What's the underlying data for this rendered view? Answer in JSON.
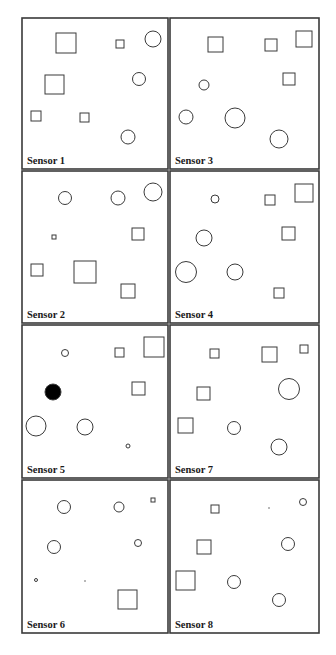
{
  "figure": {
    "colors": {
      "stroke": "#3a3a3a",
      "background": "#ffffff",
      "filled": "#000000",
      "label": "#1a1a1a"
    },
    "panels": [
      {
        "label": "Sensor 1",
        "x": 22,
        "y": 18,
        "w": 146,
        "h": 151,
        "shapes": [
          {
            "type": "square",
            "x": 56,
            "y": 33,
            "s": 20
          },
          {
            "type": "square",
            "x": 116,
            "y": 40,
            "s": 8
          },
          {
            "type": "circle",
            "cx": 153,
            "cy": 39,
            "r": 8
          },
          {
            "type": "square",
            "x": 45,
            "y": 75,
            "s": 19
          },
          {
            "type": "circle",
            "cx": 139,
            "cy": 79,
            "r": 6.5
          },
          {
            "type": "square",
            "x": 31,
            "y": 111,
            "s": 10
          },
          {
            "type": "square",
            "x": 80,
            "y": 113,
            "s": 9
          },
          {
            "type": "circle",
            "cx": 128,
            "cy": 137,
            "r": 7
          }
        ]
      },
      {
        "label": "Sensor 3",
        "x": 170,
        "y": 18,
        "w": 149,
        "h": 151,
        "shapes": [
          {
            "type": "square",
            "x": 208,
            "y": 37,
            "s": 15
          },
          {
            "type": "square",
            "x": 265,
            "y": 39,
            "s": 12
          },
          {
            "type": "square",
            "x": 296,
            "y": 31,
            "s": 16
          },
          {
            "type": "circle",
            "cx": 204,
            "cy": 85,
            "r": 5
          },
          {
            "type": "square",
            "x": 283,
            "y": 73,
            "s": 12
          },
          {
            "type": "circle",
            "cx": 186,
            "cy": 117,
            "r": 7
          },
          {
            "type": "circle",
            "cx": 235,
            "cy": 118,
            "r": 10
          },
          {
            "type": "circle",
            "cx": 279,
            "cy": 139,
            "r": 9
          }
        ]
      },
      {
        "label": "Sensor 2",
        "x": 22,
        "y": 171,
        "w": 146,
        "h": 152,
        "shapes": [
          {
            "type": "circle",
            "cx": 65,
            "cy": 198,
            "r": 6.5
          },
          {
            "type": "circle",
            "cx": 118,
            "cy": 198,
            "r": 7
          },
          {
            "type": "circle",
            "cx": 153,
            "cy": 192,
            "r": 9
          },
          {
            "type": "square",
            "x": 52,
            "y": 235,
            "s": 4
          },
          {
            "type": "square",
            "x": 132,
            "y": 228,
            "s": 12
          },
          {
            "type": "square",
            "x": 31,
            "y": 264,
            "s": 12
          },
          {
            "type": "square",
            "x": 74,
            "y": 261,
            "s": 22
          },
          {
            "type": "square",
            "x": 121,
            "y": 284,
            "s": 14
          }
        ]
      },
      {
        "label": "Sensor 4",
        "x": 170,
        "y": 171,
        "w": 149,
        "h": 152,
        "shapes": [
          {
            "type": "circle",
            "cx": 215,
            "cy": 199,
            "r": 4
          },
          {
            "type": "square",
            "x": 265,
            "y": 195,
            "s": 10
          },
          {
            "type": "square",
            "x": 295,
            "y": 184,
            "s": 18
          },
          {
            "type": "circle",
            "cx": 204,
            "cy": 238,
            "r": 8
          },
          {
            "type": "square",
            "x": 282,
            "y": 227,
            "s": 13
          },
          {
            "type": "circle",
            "cx": 186,
            "cy": 272,
            "r": 10.5
          },
          {
            "type": "circle",
            "cx": 235,
            "cy": 272,
            "r": 8
          },
          {
            "type": "square",
            "x": 274,
            "y": 288,
            "s": 10
          }
        ]
      },
      {
        "label": "Sensor 5",
        "x": 22,
        "y": 325,
        "w": 146,
        "h": 153,
        "shapes": [
          {
            "type": "circle",
            "cx": 65,
            "cy": 353,
            "r": 3.5
          },
          {
            "type": "square",
            "x": 115,
            "y": 348,
            "s": 9
          },
          {
            "type": "square",
            "x": 144,
            "y": 337,
            "s": 20
          },
          {
            "type": "circle",
            "cx": 53,
            "cy": 392,
            "r": 8,
            "filled": true
          },
          {
            "type": "square",
            "x": 132,
            "y": 382,
            "s": 13
          },
          {
            "type": "circle",
            "cx": 36,
            "cy": 426,
            "r": 10
          },
          {
            "type": "circle",
            "cx": 85,
            "cy": 427,
            "r": 8
          },
          {
            "type": "circle",
            "cx": 128,
            "cy": 446,
            "r": 2
          }
        ]
      },
      {
        "label": "Sensor 7",
        "x": 170,
        "y": 325,
        "w": 149,
        "h": 153,
        "shapes": [
          {
            "type": "square",
            "x": 210,
            "y": 349,
            "s": 9
          },
          {
            "type": "square",
            "x": 262,
            "y": 347,
            "s": 15
          },
          {
            "type": "square",
            "x": 300,
            "y": 345,
            "s": 8
          },
          {
            "type": "square",
            "x": 197,
            "y": 387,
            "s": 13
          },
          {
            "type": "circle",
            "cx": 289,
            "cy": 389,
            "r": 10.5
          },
          {
            "type": "square",
            "x": 178,
            "y": 418,
            "s": 15
          },
          {
            "type": "circle",
            "cx": 234,
            "cy": 428,
            "r": 6.5
          },
          {
            "type": "circle",
            "cx": 279,
            "cy": 447,
            "r": 8
          }
        ]
      },
      {
        "label": "Sensor 6",
        "x": 22,
        "y": 480,
        "w": 146,
        "h": 153,
        "shapes": [
          {
            "type": "circle",
            "cx": 64,
            "cy": 507,
            "r": 6.5
          },
          {
            "type": "circle",
            "cx": 119,
            "cy": 507,
            "r": 5
          },
          {
            "type": "square",
            "x": 151,
            "y": 498,
            "s": 4
          },
          {
            "type": "circle",
            "cx": 54,
            "cy": 547,
            "r": 6.5
          },
          {
            "type": "circle",
            "cx": 138,
            "cy": 543,
            "r": 3.5
          },
          {
            "type": "circle",
            "cx": 36,
            "cy": 580,
            "r": 1.5
          },
          {
            "type": "dot",
            "cx": 85,
            "cy": 581,
            "r": 0.7
          },
          {
            "type": "square",
            "x": 118,
            "y": 590,
            "s": 19
          }
        ]
      },
      {
        "label": "Sensor 8",
        "x": 170,
        "y": 480,
        "w": 149,
        "h": 153,
        "shapes": [
          {
            "type": "square",
            "x": 211,
            "y": 505,
            "s": 8
          },
          {
            "type": "dot",
            "cx": 269,
            "cy": 508,
            "r": 0.7
          },
          {
            "type": "circle",
            "cx": 303,
            "cy": 502,
            "r": 3.5
          },
          {
            "type": "square",
            "x": 197,
            "y": 540,
            "s": 14
          },
          {
            "type": "circle",
            "cx": 288,
            "cy": 544,
            "r": 6.5
          },
          {
            "type": "square",
            "x": 176,
            "y": 571,
            "s": 19
          },
          {
            "type": "circle",
            "cx": 234,
            "cy": 582,
            "r": 6.5
          },
          {
            "type": "circle",
            "cx": 279,
            "cy": 600,
            "r": 6.5
          }
        ]
      }
    ]
  }
}
